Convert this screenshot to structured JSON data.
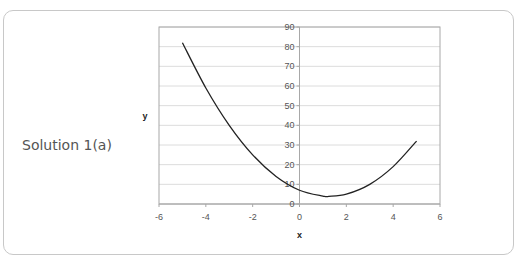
{
  "caption": "Solution 1(a)",
  "chart_data": {
    "type": "line",
    "title": "",
    "xlabel": "x",
    "ylabel": "y",
    "xlim": [
      -6,
      6
    ],
    "ylim": [
      0,
      90
    ],
    "x_ticks": [
      -6,
      -4,
      -2,
      0,
      2,
      4,
      6
    ],
    "y_ticks": [
      0,
      10,
      20,
      30,
      40,
      50,
      60,
      70,
      80,
      90
    ],
    "grid": "horizontal",
    "legend": "none",
    "series": [
      {
        "name": "y = 2x^2 - 5x + 7",
        "x": [
          -5,
          -4,
          -3,
          -2,
          -1,
          0,
          1,
          1.25,
          2,
          3,
          4,
          5
        ],
        "y": [
          82,
          59,
          40,
          25,
          14,
          7,
          4,
          3.875,
          5,
          10,
          19,
          32
        ]
      }
    ]
  }
}
